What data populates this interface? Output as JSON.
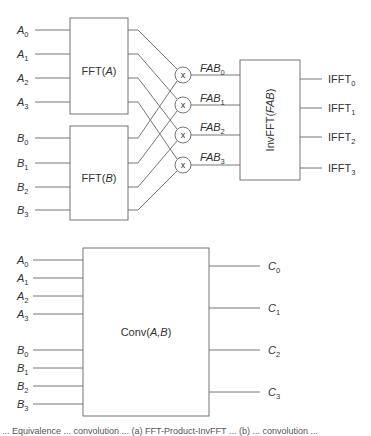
{
  "top_diagram": {
    "fft_a": {
      "label_prefix": "FFT(",
      "label_var": "A",
      "label_suffix": ")",
      "inputs": [
        {
          "var": "A",
          "sub": "0"
        },
        {
          "var": "A",
          "sub": "1"
        },
        {
          "var": "A",
          "sub": "2"
        },
        {
          "var": "A",
          "sub": "3"
        }
      ]
    },
    "fft_b": {
      "label_prefix": "FFT(",
      "label_var": "B",
      "label_suffix": ")",
      "inputs": [
        {
          "var": "B",
          "sub": "0"
        },
        {
          "var": "B",
          "sub": "1"
        },
        {
          "var": "B",
          "sub": "2"
        },
        {
          "var": "B",
          "sub": "3"
        }
      ]
    },
    "multipliers": [
      {
        "symbol": "x",
        "output": {
          "var": "FAB",
          "sub": "0"
        }
      },
      {
        "symbol": "x",
        "output": {
          "var": "FAB",
          "sub": "1"
        }
      },
      {
        "symbol": "x",
        "output": {
          "var": "FAB",
          "sub": "2"
        }
      },
      {
        "symbol": "x",
        "output": {
          "var": "FAB",
          "sub": "3"
        }
      }
    ],
    "inv_fft": {
      "label_prefix": "InvFFT(",
      "label_var": "FAB",
      "label_suffix": ")",
      "outputs": [
        {
          "name": "IFFT",
          "sub": "0"
        },
        {
          "name": "IFFT",
          "sub": "1"
        },
        {
          "name": "IFFT",
          "sub": "2"
        },
        {
          "name": "IFFT",
          "sub": "3"
        }
      ]
    }
  },
  "bottom_diagram": {
    "conv": {
      "label_prefix": "Conv(",
      "label_var": "A,B",
      "label_suffix": ")",
      "inputs_a": [
        {
          "var": "A",
          "sub": "0"
        },
        {
          "var": "A",
          "sub": "1"
        },
        {
          "var": "A",
          "sub": "2"
        },
        {
          "var": "A",
          "sub": "3"
        }
      ],
      "inputs_b": [
        {
          "var": "B",
          "sub": "0"
        },
        {
          "var": "B",
          "sub": "1"
        },
        {
          "var": "B",
          "sub": "2"
        },
        {
          "var": "B",
          "sub": "3"
        }
      ],
      "outputs": [
        {
          "var": "C",
          "sub": "0"
        },
        {
          "var": "C",
          "sub": "1"
        },
        {
          "var": "C",
          "sub": "2"
        },
        {
          "var": "C",
          "sub": "3"
        }
      ]
    }
  },
  "caption": {
    "text": "... Equivalence ... convolution ... (a) FFT-Product-InvFFT ... (b) ... convolution ..."
  },
  "colors": {
    "line": "#666666",
    "text": "#333333",
    "background": "#ffffff"
  }
}
